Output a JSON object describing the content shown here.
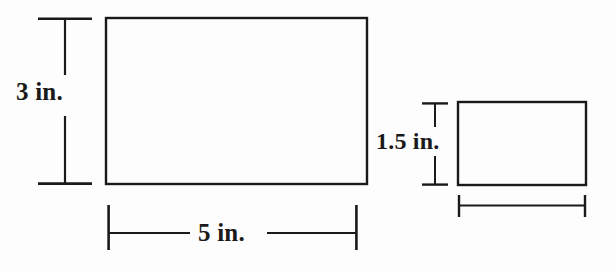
{
  "figure": {
    "background_color": "#fdfdfd",
    "stroke_color": "#1a1a1a",
    "shapes": [
      {
        "name": "large-rectangle",
        "type": "rectangle",
        "x": 106,
        "y": 18,
        "width": 261,
        "height": 166,
        "stroke_width": 2.4
      },
      {
        "name": "small-rectangle",
        "type": "rectangle",
        "x": 458,
        "y": 102,
        "width": 128,
        "height": 83,
        "stroke_width": 2.4
      }
    ],
    "dimensions": [
      {
        "name": "large-rectangle-height",
        "label": "3 in.",
        "orientation": "vertical",
        "line_x": 65,
        "from": 18,
        "to": 184,
        "cap_half_length": 27
      },
      {
        "name": "large-rectangle-width",
        "label": "5 in.",
        "orientation": "horizontal",
        "line_y": 233,
        "from": 108,
        "to": 357,
        "cap_half_length": 23
      },
      {
        "name": "small-rectangle-height",
        "label": "1.5 in.",
        "orientation": "vertical",
        "line_x": 435,
        "from": 103,
        "to": 185,
        "cap_half_length": 13
      },
      {
        "name": "small-rectangle-width",
        "label": "",
        "orientation": "horizontal",
        "line_y": 205,
        "from": 458,
        "to": 586,
        "cap_half_length": 10
      }
    ]
  },
  "labels": {
    "large_height": "3 in.",
    "large_width": "5 in.",
    "small_height": "1.5 in.",
    "small_width": ""
  }
}
